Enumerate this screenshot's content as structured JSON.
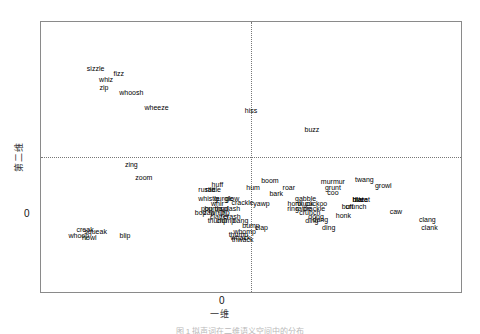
{
  "figure": {
    "caption": "图 1  拟声词在二维语义空间中的分布",
    "axes": {
      "xlabel": "一维",
      "ylabel": "第二维",
      "xtick_zero": "0",
      "ytick_zero": "0"
    }
  },
  "chart_data": {
    "type": "scatter",
    "title": "",
    "xlabel": "一维",
    "ylabel": "第二维",
    "xlim": [
      -1.0,
      1.0
    ],
    "ylim": [
      -1.0,
      1.0
    ],
    "grid": false,
    "legend": null,
    "reference_lines": {
      "x": 0,
      "y": 0,
      "style": "dotted"
    },
    "note": "Points are rendered as text labels only; no marker glyphs are drawn.",
    "points": [
      {
        "label": "sizzle",
        "x": -0.74,
        "y": 0.66
      },
      {
        "label": "fizz",
        "x": -0.63,
        "y": 0.62
      },
      {
        "label": "whiz",
        "x": -0.69,
        "y": 0.58
      },
      {
        "label": "zip",
        "x": -0.7,
        "y": 0.52
      },
      {
        "label": "whoosh",
        "x": -0.57,
        "y": 0.48
      },
      {
        "label": "wheeze",
        "x": -0.45,
        "y": 0.37
      },
      {
        "label": "hiss",
        "x": 0.0,
        "y": 0.35
      },
      {
        "label": "buzz",
        "x": 0.29,
        "y": 0.21
      },
      {
        "label": "zing",
        "x": -0.57,
        "y": -0.05
      },
      {
        "label": "zoom",
        "x": -0.51,
        "y": -0.15
      },
      {
        "label": "huff",
        "x": -0.16,
        "y": -0.2
      },
      {
        "label": "rustle",
        "x": -0.21,
        "y": -0.24
      },
      {
        "label": "rattle",
        "x": -0.18,
        "y": -0.24
      },
      {
        "label": "whistle",
        "x": -0.2,
        "y": -0.3
      },
      {
        "label": "gurgle",
        "x": -0.13,
        "y": -0.3
      },
      {
        "label": "glow",
        "x": -0.09,
        "y": -0.3
      },
      {
        "label": "boom",
        "x": 0.09,
        "y": -0.17
      },
      {
        "label": "hum",
        "x": 0.01,
        "y": -0.22
      },
      {
        "label": "roar",
        "x": 0.18,
        "y": -0.22
      },
      {
        "label": "bark",
        "x": 0.12,
        "y": -0.27
      },
      {
        "label": "murmur",
        "x": 0.39,
        "y": -0.18
      },
      {
        "label": "grunt",
        "x": 0.39,
        "y": -0.22
      },
      {
        "label": "coo",
        "x": 0.39,
        "y": -0.26
      },
      {
        "label": "gabble",
        "x": 0.26,
        "y": -0.3
      },
      {
        "label": "twang",
        "x": 0.54,
        "y": -0.16
      },
      {
        "label": "growl",
        "x": 0.63,
        "y": -0.21
      },
      {
        "label": "blat",
        "x": 0.51,
        "y": -0.31
      },
      {
        "label": "bleat",
        "x": 0.53,
        "y": -0.31
      },
      {
        "label": "blare",
        "x": 0.52,
        "y": -0.31
      },
      {
        "label": "whir",
        "x": -0.16,
        "y": -0.34
      },
      {
        "label": "crackle",
        "x": -0.04,
        "y": -0.33
      },
      {
        "label": "yawp",
        "x": 0.05,
        "y": -0.34
      },
      {
        "label": "honk",
        "x": 0.21,
        "y": -0.34
      },
      {
        "label": "cluck",
        "x": 0.26,
        "y": -0.34
      },
      {
        "label": "cuckoo",
        "x": 0.31,
        "y": -0.34
      },
      {
        "label": "buff",
        "x": 0.46,
        "y": -0.36
      },
      {
        "label": "crunch",
        "x": 0.5,
        "y": -0.36
      },
      {
        "label": "pop",
        "x": -0.21,
        "y": -0.38
      },
      {
        "label": "bump",
        "x": -0.18,
        "y": -0.38
      },
      {
        "label": "thud",
        "x": -0.14,
        "y": -0.38
      },
      {
        "label": "splash",
        "x": -0.1,
        "y": -0.38
      },
      {
        "label": "ring",
        "x": 0.2,
        "y": -0.38
      },
      {
        "label": "rattle",
        "x": 0.25,
        "y": -0.38
      },
      {
        "label": "crackle2",
        "x": 0.3,
        "y": -0.38
      },
      {
        "label": "bop",
        "x": -0.24,
        "y": -0.41
      },
      {
        "label": "zap",
        "x": -0.2,
        "y": -0.41
      },
      {
        "label": "whip",
        "x": -0.16,
        "y": -0.41
      },
      {
        "label": "rip",
        "x": -0.12,
        "y": -0.41
      },
      {
        "label": "crunch2",
        "x": 0.28,
        "y": -0.41
      },
      {
        "label": "honk2",
        "x": 0.44,
        "y": -0.43
      },
      {
        "label": "clatter",
        "x": -0.15,
        "y": -0.44
      },
      {
        "label": "crash",
        "x": -0.09,
        "y": -0.44
      },
      {
        "label": "thump",
        "x": -0.16,
        "y": -0.47
      },
      {
        "label": "clomp",
        "x": -0.12,
        "y": -0.47
      },
      {
        "label": "bang",
        "x": -0.05,
        "y": -0.47
      },
      {
        "label": "dong",
        "x": 0.31,
        "y": -0.44
      },
      {
        "label": "dang",
        "x": 0.33,
        "y": -0.46
      },
      {
        "label": "ding",
        "x": 0.29,
        "y": -0.47
      },
      {
        "label": "bump2",
        "x": 0.0,
        "y": -0.5
      },
      {
        "label": "clap",
        "x": 0.05,
        "y": -0.52
      },
      {
        "label": "ding2",
        "x": 0.37,
        "y": -0.52
      },
      {
        "label": "whomp",
        "x": -0.03,
        "y": -0.55
      },
      {
        "label": "thump2",
        "x": -0.06,
        "y": -0.57
      },
      {
        "label": "whack",
        "x": -0.05,
        "y": -0.59
      },
      {
        "label": "thwack",
        "x": -0.04,
        "y": -0.61
      },
      {
        "label": "caw",
        "x": 0.69,
        "y": -0.4
      },
      {
        "label": "clang",
        "x": 0.84,
        "y": -0.46
      },
      {
        "label": "clank",
        "x": 0.85,
        "y": -0.52
      },
      {
        "label": "creak",
        "x": -0.79,
        "y": -0.53
      },
      {
        "label": "squeak",
        "x": -0.74,
        "y": -0.55
      },
      {
        "label": "whoop",
        "x": -0.82,
        "y": -0.58
      },
      {
        "label": "howl",
        "x": -0.77,
        "y": -0.59
      },
      {
        "label": "blip",
        "x": -0.6,
        "y": -0.58
      }
    ]
  }
}
